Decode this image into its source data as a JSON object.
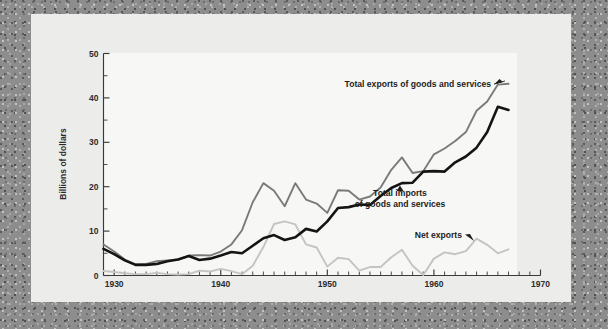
{
  "figure": {
    "background_color": "#8d8d8d",
    "page_color": "#ececeb",
    "plot_color": "#f7f7f6"
  },
  "chart_data": {
    "type": "line",
    "title": "",
    "xlabel": "",
    "ylabel": "Billions of dollars",
    "xlim": [
      1929,
      1970
    ],
    "ylim": [
      0,
      50
    ],
    "yticks": [
      0,
      10,
      20,
      30,
      40,
      50
    ],
    "ytick_labels": [
      "0",
      "10",
      "20",
      "30",
      "40",
      "50"
    ],
    "y_minor_step": 5,
    "xticks": [
      1930,
      1940,
      1950,
      1960,
      1970
    ],
    "xtick_labels": [
      "1930",
      "1940",
      "1950",
      "1960",
      "1970"
    ],
    "x_minor_step": 1,
    "grid": false,
    "legend": "annotations",
    "x": [
      1929,
      1930,
      1931,
      1932,
      1933,
      1934,
      1935,
      1936,
      1937,
      1938,
      1939,
      1940,
      1941,
      1942,
      1943,
      1944,
      1945,
      1946,
      1947,
      1948,
      1949,
      1950,
      1951,
      1952,
      1953,
      1954,
      1955,
      1956,
      1957,
      1958,
      1959,
      1960,
      1961,
      1962,
      1963,
      1964,
      1965,
      1966,
      1967
    ],
    "series": [
      {
        "name": "Total exports of goods and services",
        "color": "#7a7a7a",
        "width": 1.9,
        "values": [
          7.0,
          5.4,
          3.6,
          2.5,
          2.6,
          3.2,
          3.4,
          3.6,
          4.5,
          4.6,
          4.5,
          5.4,
          7.0,
          10.2,
          16.5,
          20.8,
          19.1,
          15.6,
          20.8,
          17.1,
          16.2,
          14.1,
          19.2,
          19.1,
          17.1,
          17.8,
          19.8,
          23.8,
          26.6,
          23.1,
          23.5,
          27.3,
          28.6,
          30.3,
          32.3,
          37.1,
          39.2,
          43.0,
          43.2
        ]
      },
      {
        "name": "Total imports of goods and services",
        "color": "#141414",
        "width": 2.6,
        "values": [
          6.0,
          4.8,
          3.4,
          2.4,
          2.4,
          2.6,
          3.2,
          3.6,
          4.4,
          3.5,
          3.8,
          4.5,
          5.3,
          5.0,
          6.7,
          8.4,
          9.1,
          8.0,
          8.6,
          10.5,
          9.9,
          12.2,
          15.2,
          15.4,
          16.0,
          15.9,
          17.9,
          19.7,
          20.8,
          20.9,
          23.4,
          23.5,
          23.4,
          25.5,
          26.8,
          28.8,
          32.3,
          38.0,
          37.3
        ]
      },
      {
        "name": "Net exports",
        "color": "#c4c4c4",
        "width": 1.9,
        "values": [
          1.0,
          0.8,
          0.5,
          0.3,
          0.3,
          0.6,
          0.3,
          0.2,
          0.3,
          1.1,
          0.9,
          1.5,
          1.0,
          0.3,
          2.2,
          6.4,
          11.6,
          12.2,
          11.5,
          7.0,
          6.3,
          2.0,
          4.0,
          3.7,
          1.1,
          1.9,
          1.9,
          4.1,
          5.8,
          2.2,
          0.1,
          3.8,
          5.2,
          4.8,
          5.5,
          8.3,
          6.9,
          5.0,
          5.9
        ]
      }
    ],
    "annotations": [
      {
        "text": "Total exports of goods and services",
        "target_series": "Total exports of goods and services",
        "arrow": "right-up"
      },
      {
        "text_line1": "Total imports",
        "text_line2": "of goods and services",
        "target_series": "Total imports of goods and services",
        "arrow": "up"
      },
      {
        "text": "Net exports",
        "target_series": "Net exports",
        "arrow": "down-right"
      }
    ]
  }
}
